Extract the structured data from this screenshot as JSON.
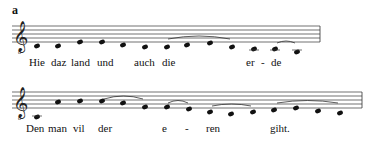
{
  "figure_label": "a",
  "systems": [
    {
      "staff": {
        "x1": 12,
        "x2": 320,
        "top": 26,
        "spacing": 4
      },
      "clef": "treble-8vb",
      "notes": [
        {
          "x": 37,
          "y": 46
        },
        {
          "x": 58,
          "y": 46
        },
        {
          "x": 80,
          "y": 42
        },
        {
          "x": 102,
          "y": 42
        },
        {
          "x": 123,
          "y": 45
        },
        {
          "x": 145,
          "y": 47
        },
        {
          "x": 167,
          "y": 47
        },
        {
          "x": 187,
          "y": 45
        },
        {
          "x": 210,
          "y": 43
        },
        {
          "x": 232,
          "y": 47
        },
        {
          "x": 254,
          "y": 49
        },
        {
          "x": 275,
          "y": 49
        },
        {
          "x": 297,
          "y": 52
        }
      ],
      "slurs": [
        {
          "x1": 168,
          "x2": 230,
          "y": 39,
          "h": 6
        },
        {
          "x1": 277,
          "x2": 295,
          "y": 43,
          "h": 4
        }
      ],
      "lyrics": [
        {
          "text": "Hie",
          "x": 29,
          "y": 56
        },
        {
          "text": "daz",
          "x": 51,
          "y": 56
        },
        {
          "text": "land",
          "x": 71,
          "y": 56
        },
        {
          "text": "und",
          "x": 97,
          "y": 56
        },
        {
          "text": "auch",
          "x": 134,
          "y": 56
        },
        {
          "text": "die",
          "x": 162,
          "y": 56
        },
        {
          "text": "er",
          "x": 246,
          "y": 56
        },
        {
          "text": "-",
          "x": 261,
          "y": 56
        },
        {
          "text": "de",
          "x": 271,
          "y": 56
        }
      ]
    },
    {
      "staff": {
        "x1": 12,
        "x2": 362,
        "top": 92,
        "spacing": 4
      },
      "clef": "treble-8vb",
      "notes": [
        {
          "x": 37,
          "y": 117
        },
        {
          "x": 58,
          "y": 102
        },
        {
          "x": 80,
          "y": 101
        },
        {
          "x": 102,
          "y": 101
        },
        {
          "x": 123,
          "y": 103
        },
        {
          "x": 145,
          "y": 107
        },
        {
          "x": 167,
          "y": 107
        },
        {
          "x": 189,
          "y": 109
        },
        {
          "x": 210,
          "y": 112
        },
        {
          "x": 231,
          "y": 114
        },
        {
          "x": 253,
          "y": 112
        },
        {
          "x": 274,
          "y": 110
        },
        {
          "x": 296,
          "y": 108
        },
        {
          "x": 318,
          "y": 111
        },
        {
          "x": 340,
          "y": 113
        }
      ],
      "slurs": [
        {
          "x1": 104,
          "x2": 143,
          "y": 99,
          "h": 6
        },
        {
          "x1": 168,
          "x2": 188,
          "y": 103,
          "h": 5
        },
        {
          "x1": 212,
          "x2": 251,
          "y": 106,
          "h": 4
        },
        {
          "x1": 277,
          "x2": 338,
          "y": 103,
          "h": 5
        }
      ],
      "lyrics": [
        {
          "text": "Den",
          "x": 26,
          "y": 122
        },
        {
          "text": "man",
          "x": 48,
          "y": 122
        },
        {
          "text": "vil",
          "x": 73,
          "y": 122
        },
        {
          "text": "der",
          "x": 98,
          "y": 122
        },
        {
          "text": "e",
          "x": 162,
          "y": 122
        },
        {
          "text": "-",
          "x": 185,
          "y": 122
        },
        {
          "text": "ren",
          "x": 206,
          "y": 122
        },
        {
          "text": "giht.",
          "x": 270,
          "y": 122
        }
      ]
    }
  ]
}
